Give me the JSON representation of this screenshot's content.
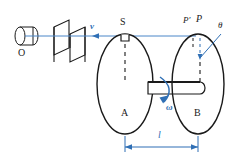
{
  "figure": {
    "type": "physics-optics-diagram"
  },
  "colors": {
    "ink": "#1a1a1a",
    "ray": "#4a86c8",
    "annotation": "#2f6fb5",
    "background": "#ffffff"
  },
  "labels": {
    "source": "O",
    "velocity": "v",
    "slit": "S",
    "disc_a": "A",
    "disc_b": "B",
    "angular_velocity": "ω",
    "point_p_prime": "P′",
    "point_p": "P",
    "angle_theta": "θ",
    "separation": "l"
  },
  "parts": {
    "lamp_name": "light-source-cylinder",
    "plate1_name": "collimator-plate-front",
    "plate2_name": "collimator-plate-rear",
    "axle_name": "rotating-axle",
    "ray_name": "light-ray-line",
    "dimension_name": "separation-dimension-line"
  }
}
